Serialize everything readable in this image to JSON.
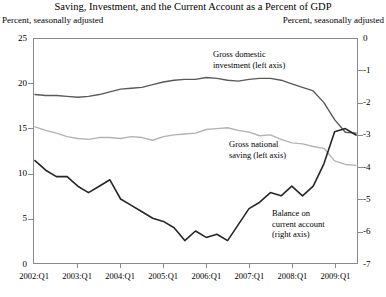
{
  "chart_data": {
    "type": "line",
    "title": "Saving, Investment, and the Current Account as a Percent of GDP",
    "left_axis_note": "Percent, seasonally adjusted",
    "right_axis_note": "Percent, seasonally adjusted",
    "xlabel": "",
    "ylabel": "",
    "grid": false,
    "legend_position": "inline-annotations",
    "left_ylim": [
      0,
      25
    ],
    "left_yticks": [
      0,
      5,
      10,
      15,
      20,
      25
    ],
    "left_yticklabels": [
      "0",
      "5",
      "10",
      "15",
      "20",
      "25"
    ],
    "right_ylim": [
      -7,
      0
    ],
    "right_yticks": [
      -7,
      -6,
      -5,
      -4,
      -3,
      -2,
      -1,
      0
    ],
    "right_yticklabels": [
      "-7",
      "-6",
      "-5",
      "-4",
      "-3",
      "-2",
      "-1",
      "0"
    ],
    "xticklabels": [
      "2002:Q1",
      "2003:Q1",
      "2004:Q1",
      "2005:Q1",
      "2006:Q1",
      "2007:Q1",
      "2008:Q1",
      "2009:Q1"
    ],
    "x": [
      "2002:Q1",
      "2002:Q2",
      "2002:Q3",
      "2002:Q4",
      "2003:Q1",
      "2003:Q2",
      "2003:Q3",
      "2003:Q4",
      "2004:Q1",
      "2004:Q2",
      "2004:Q3",
      "2004:Q4",
      "2005:Q1",
      "2005:Q2",
      "2005:Q3",
      "2005:Q4",
      "2006:Q1",
      "2006:Q2",
      "2006:Q3",
      "2006:Q4",
      "2007:Q1",
      "2007:Q2",
      "2007:Q3",
      "2007:Q4",
      "2008:Q1",
      "2008:Q2",
      "2008:Q3",
      "2008:Q4",
      "2009:Q1",
      "2009:Q2",
      "2009:Q3"
    ],
    "series": [
      {
        "name": "Gross domestic investment (left axis)",
        "axis": "left",
        "color": "#595959",
        "annotation": [
          "Gross domestic",
          "investment (left axis)"
        ],
        "values": [
          18.8,
          18.7,
          18.7,
          18.6,
          18.5,
          18.6,
          18.8,
          19.1,
          19.4,
          19.5,
          19.6,
          19.9,
          20.2,
          20.4,
          20.5,
          20.5,
          20.7,
          20.6,
          20.4,
          20.3,
          20.5,
          20.6,
          20.6,
          20.4,
          20.0,
          19.6,
          19.2,
          17.9,
          16.0,
          14.6,
          14.5
        ]
      },
      {
        "name": "Gross national saving (left axis)",
        "axis": "left",
        "color": "#b3b3b3",
        "annotation": [
          "Gross national",
          "saving (left axis)"
        ],
        "values": [
          15.2,
          14.8,
          14.5,
          14.1,
          13.9,
          13.8,
          14.0,
          14.0,
          13.9,
          14.1,
          14.0,
          13.7,
          14.1,
          14.3,
          14.4,
          14.5,
          14.9,
          15.0,
          15.1,
          14.8,
          14.6,
          14.2,
          14.3,
          13.8,
          13.4,
          13.3,
          13.0,
          12.8,
          11.4,
          11.0,
          10.9
        ]
      },
      {
        "name": "Balance on current account (right axis)",
        "axis": "right",
        "color": "#262626",
        "annotation": [
          "Balance on",
          "current account",
          "(right axis)"
        ],
        "values": [
          -3.8,
          -4.1,
          -4.3,
          -4.3,
          -4.6,
          -4.8,
          -4.6,
          -4.4,
          -5.0,
          -5.2,
          -5.4,
          -5.6,
          -5.7,
          -5.9,
          -6.3,
          -6.0,
          -6.2,
          -6.1,
          -6.3,
          -5.8,
          -5.3,
          -5.1,
          -4.8,
          -4.9,
          -4.6,
          -4.9,
          -4.6,
          -3.9,
          -2.9,
          -2.8,
          -3.0
        ]
      }
    ]
  }
}
